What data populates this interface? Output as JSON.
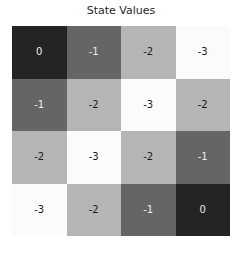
{
  "chart_data": {
    "type": "heatmap",
    "title": "State Values",
    "rows": 4,
    "cols": 4,
    "matrix": [
      [
        0,
        -1,
        -2,
        -3
      ],
      [
        -1,
        -2,
        -3,
        -2
      ],
      [
        -2,
        -3,
        -2,
        -1
      ],
      [
        -3,
        -2,
        -1,
        0
      ]
    ],
    "colormap": "grayscale (0 = darkest, -3 = lightest)",
    "value_colors": {
      "0": "#242424",
      "-1": "#656565",
      "-2": "#b5b5b5",
      "-3": "#fbfbfb"
    },
    "value_text_colors": {
      "0": "#ededed",
      "-1": "#ededed",
      "-2": "#1b1b1b",
      "-3": "#1b1b1b"
    },
    "axes": "none",
    "legend": "none",
    "grid": "off"
  }
}
